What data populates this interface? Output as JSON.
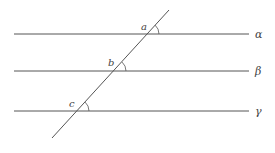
{
  "diagram": {
    "title": "",
    "lines": [
      {
        "name": "alpha",
        "label": "α",
        "y": 34
      },
      {
        "name": "beta",
        "label": "β",
        "y": 71
      },
      {
        "name": "gamma",
        "label": "γ",
        "y": 111
      }
    ],
    "transversal": {
      "x1": 169,
      "y1": 10,
      "x2": 52,
      "y2": 138
    },
    "angles": [
      {
        "name": "a",
        "label": "a",
        "cx": 147,
        "cy": 34
      },
      {
        "name": "b",
        "label": "b",
        "cx": 114,
        "cy": 71
      },
      {
        "name": "c",
        "label": "c",
        "cx": 77,
        "cy": 111
      }
    ],
    "colors": {
      "line": "#555555",
      "text": "#444444"
    }
  }
}
